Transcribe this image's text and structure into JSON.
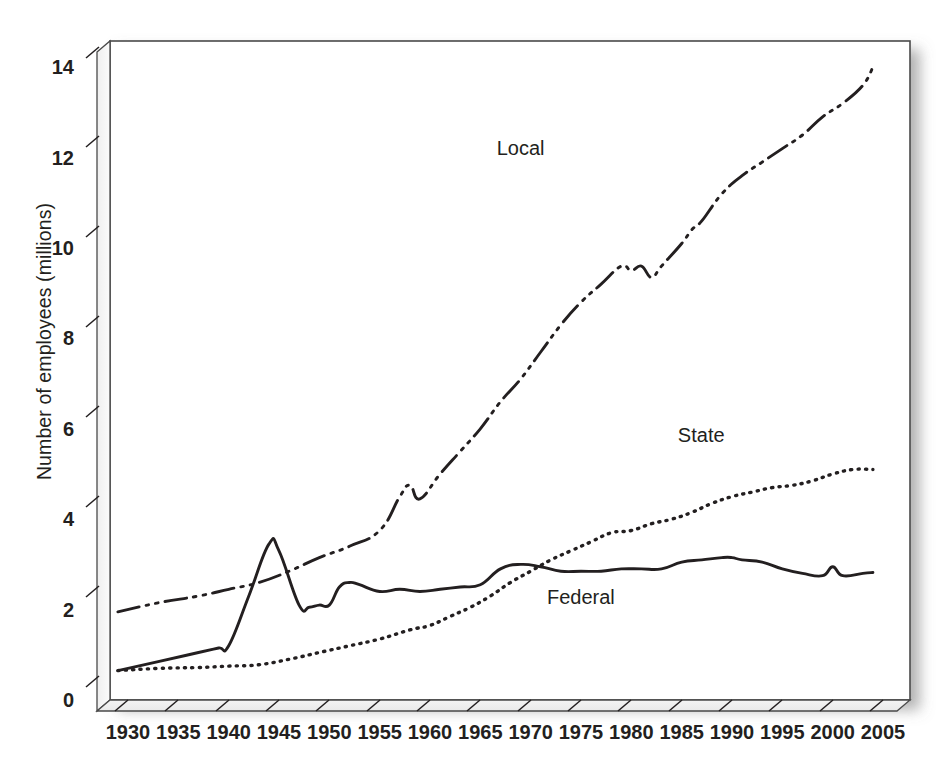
{
  "chart_data": {
    "type": "line",
    "title": "",
    "xlabel": "",
    "ylabel": "Number of employees (millions)",
    "xlim": [
      1929,
      2006
    ],
    "ylim": [
      0,
      14
    ],
    "ytick_labels": [
      "0",
      "2",
      "4",
      "6",
      "8",
      "10",
      "12",
      "14"
    ],
    "ytick_values": [
      0,
      2,
      4,
      6,
      8,
      10,
      12,
      14
    ],
    "xtick_labels": [
      "1930",
      "1935",
      "1940",
      "1945",
      "1950",
      "1955",
      "1960",
      "1965",
      "1970",
      "1975",
      "1980",
      "1985",
      "1990",
      "1995",
      "2000",
      "2005"
    ],
    "xtick_values": [
      1930,
      1935,
      1940,
      1945,
      1950,
      1955,
      1960,
      1965,
      1970,
      1975,
      1980,
      1985,
      1990,
      1995,
      2000,
      2005
    ],
    "grid": false,
    "legend_position": "inline-annotations",
    "series": [
      {
        "name": "Local",
        "label": "Local",
        "line_style": "dash-dot-dot",
        "color": "#231f20",
        "x": [
          1929,
          1933,
          1937,
          1940,
          1943,
          1946,
          1949,
          1952,
          1955,
          1957,
          1958,
          1959,
          1961,
          1963,
          1965,
          1967,
          1969,
          1971,
          1973,
          1975,
          1977,
          1979,
          1980,
          1981,
          1982,
          1983,
          1985,
          1986,
          1987,
          1989,
          1991,
          1993,
          1995,
          1997,
          1999,
          2001,
          2003,
          2004
        ],
        "y": [
          1.95,
          2.15,
          2.3,
          2.45,
          2.6,
          2.85,
          3.15,
          3.4,
          3.75,
          4.5,
          4.75,
          4.45,
          5.0,
          5.5,
          6.0,
          6.6,
          7.1,
          7.7,
          8.3,
          8.8,
          9.2,
          9.6,
          9.5,
          9.6,
          9.35,
          9.6,
          10.1,
          10.4,
          10.6,
          11.2,
          11.6,
          11.9,
          12.2,
          12.5,
          12.9,
          13.2,
          13.6,
          14.0
        ]
      },
      {
        "name": "State",
        "label": "State",
        "line_style": "dotted",
        "color": "#231f20",
        "x": [
          1929,
          1933,
          1937,
          1940,
          1943,
          1946,
          1949,
          1952,
          1955,
          1958,
          1960,
          1962,
          1964,
          1966,
          1968,
          1970,
          1972,
          1974,
          1976,
          1978,
          1980,
          1982,
          1984,
          1986,
          1988,
          1990,
          1992,
          1994,
          1996,
          1998,
          2000,
          2002,
          2004
        ],
        "y": [
          0.65,
          0.7,
          0.72,
          0.75,
          0.78,
          0.9,
          1.05,
          1.2,
          1.35,
          1.55,
          1.65,
          1.85,
          2.05,
          2.3,
          2.6,
          2.85,
          3.1,
          3.3,
          3.5,
          3.7,
          3.75,
          3.9,
          4.0,
          4.15,
          4.35,
          4.5,
          4.6,
          4.7,
          4.75,
          4.85,
          5.0,
          5.1,
          5.1
        ]
      },
      {
        "name": "Federal",
        "label": "Federal",
        "line_style": "solid",
        "color": "#231f20",
        "x": [
          1929,
          1933,
          1937,
          1939,
          1940,
          1942,
          1944,
          1945,
          1947,
          1948,
          1949,
          1950,
          1951,
          1952,
          1953,
          1955,
          1957,
          1959,
          1961,
          1963,
          1965,
          1967,
          1969,
          1971,
          1973,
          1975,
          1977,
          1979,
          1981,
          1983,
          1985,
          1987,
          1989,
          1990,
          1991,
          1993,
          1995,
          1997,
          1999,
          2000,
          2001,
          2003,
          2004
        ],
        "y": [
          0.65,
          0.85,
          1.05,
          1.15,
          1.2,
          2.3,
          3.45,
          3.3,
          2.1,
          2.05,
          2.1,
          2.1,
          2.5,
          2.6,
          2.55,
          2.4,
          2.45,
          2.4,
          2.45,
          2.5,
          2.55,
          2.9,
          3.0,
          2.95,
          2.85,
          2.85,
          2.85,
          2.9,
          2.9,
          2.9,
          3.05,
          3.1,
          3.15,
          3.15,
          3.1,
          3.05,
          2.9,
          2.8,
          2.75,
          2.95,
          2.75,
          2.8,
          2.82
        ]
      }
    ],
    "annotations": [
      {
        "text": "Local",
        "x": 1970,
        "y": 12.2
      },
      {
        "text": "State",
        "x": 1988,
        "y": 5.85
      },
      {
        "text": "Federal",
        "x": 1975,
        "y": 2.25
      }
    ]
  },
  "axis": {
    "y_title": "Number of employees (millions)"
  }
}
